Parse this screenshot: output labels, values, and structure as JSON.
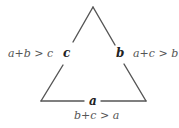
{
  "diagram": {
    "type": "triangle-inequality",
    "stroke_color": "#555555",
    "sides": {
      "a": {
        "label": "a",
        "inequality": "b+c > a"
      },
      "b": {
        "label": "b",
        "inequality": "a+c > b"
      },
      "c": {
        "label": "c",
        "inequality": "a+b > c"
      }
    }
  }
}
